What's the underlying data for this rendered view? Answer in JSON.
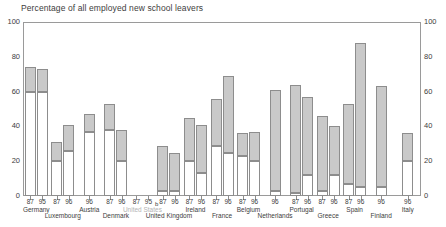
{
  "chart_data": {
    "type": "bar",
    "title": "Percentage of all employed new school leavers",
    "xlabel": "",
    "ylabel": "",
    "ylim": [
      0,
      100
    ],
    "yticks": [
      0,
      20,
      40,
      60,
      80,
      100
    ],
    "grid": false,
    "legend": null,
    "note_marker": "b",
    "series": [
      {
        "name": "lower-segment",
        "color": "#ffffff"
      },
      {
        "name": "upper-segment",
        "color": "#c9c9c9"
      }
    ],
    "groups": [
      {
        "country": "Germany",
        "bars": [
          {
            "year": "87",
            "total": 74,
            "split": 60
          },
          {
            "year": "95",
            "total": 73,
            "split": 60
          }
        ]
      },
      {
        "country": "Luxembourg",
        "bars": [
          {
            "year": "87",
            "total": 31,
            "split": 20
          },
          {
            "year": "96",
            "total": 41,
            "split": 26
          }
        ]
      },
      {
        "country": "Austria",
        "bars": [
          {
            "year": "96",
            "total": 47,
            "split": 37
          }
        ]
      },
      {
        "country": "Denmark",
        "bars": [
          {
            "year": "87",
            "total": 53,
            "split": 38
          },
          {
            "year": "96",
            "total": 38,
            "split": 20
          }
        ]
      },
      {
        "country": "United States",
        "muted": true,
        "bars": [
          {
            "year": "87",
            "total": 0,
            "split": 0
          },
          {
            "year": "95",
            "total": 0,
            "split": 0
          }
        ]
      },
      {
        "country": "United Kingdom",
        "bars": [
          {
            "year": "87",
            "total": 29,
            "split": 3
          },
          {
            "year": "96",
            "total": 25,
            "split": 3
          }
        ]
      },
      {
        "country": "Ireland",
        "bars": [
          {
            "year": "87",
            "total": 45,
            "split": 20
          },
          {
            "year": "96",
            "total": 41,
            "split": 13
          }
        ]
      },
      {
        "country": "France",
        "bars": [
          {
            "year": "87",
            "total": 56,
            "split": 29
          },
          {
            "year": "96",
            "total": 69,
            "split": 25
          }
        ]
      },
      {
        "country": "Belgium",
        "bars": [
          {
            "year": "87",
            "total": 36,
            "split": 23
          },
          {
            "year": "96",
            "total": 37,
            "split": 20
          }
        ]
      },
      {
        "country": "Netherlands",
        "bars": [
          {
            "year": "96",
            "total": 61,
            "split": 3
          }
        ]
      },
      {
        "country": "Portugal",
        "bars": [
          {
            "year": "87",
            "total": 64,
            "split": 2
          },
          {
            "year": "96",
            "total": 57,
            "split": 12
          }
        ]
      },
      {
        "country": "Greece",
        "bars": [
          {
            "year": "87",
            "total": 46,
            "split": 3
          },
          {
            "year": "96",
            "total": 40,
            "split": 12
          }
        ]
      },
      {
        "country": "Spain",
        "bars": [
          {
            "year": "87",
            "total": 53,
            "split": 7
          },
          {
            "year": "96",
            "total": 88,
            "split": 5
          }
        ]
      },
      {
        "country": "Finland",
        "bars": [
          {
            "year": "96",
            "total": 63,
            "split": 5
          }
        ]
      },
      {
        "country": "Italy",
        "bars": [
          {
            "year": "96",
            "total": 36,
            "split": 20
          }
        ]
      }
    ]
  }
}
